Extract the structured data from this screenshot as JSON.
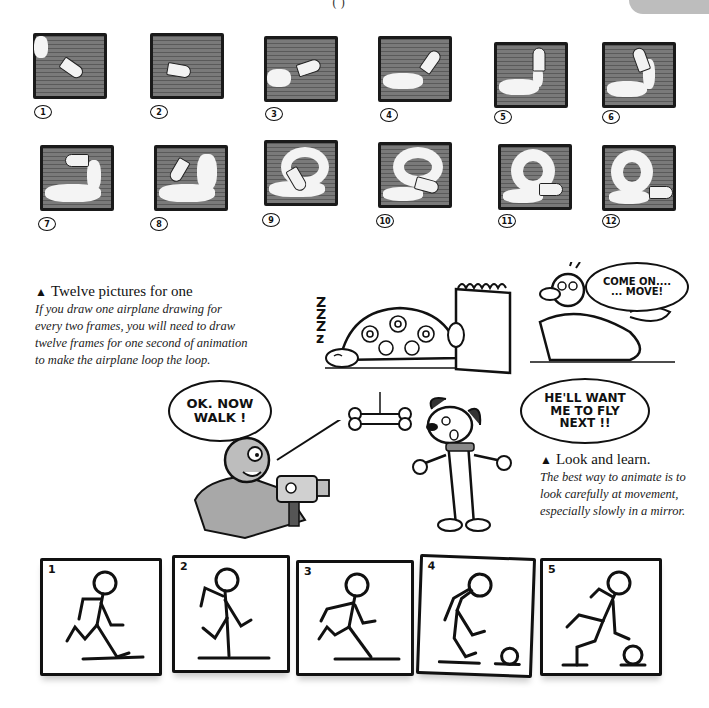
{
  "page": {
    "header_fragment": "( )"
  },
  "airplane_sequence": {
    "frames": [
      {
        "label": "1"
      },
      {
        "label": "2"
      },
      {
        "label": "3"
      },
      {
        "label": "4"
      },
      {
        "label": "5"
      },
      {
        "label": "6"
      },
      {
        "label": "7"
      },
      {
        "label": "8"
      },
      {
        "label": "9"
      },
      {
        "label": "10"
      },
      {
        "label": "11"
      },
      {
        "label": "12"
      }
    ]
  },
  "caption_twelve": {
    "marker": "▲",
    "title": "Twelve pictures for one",
    "body": "If you draw one airplane drawing for every two frames, you will need to draw twelve frames for one second of animation to make the airplane loop the loop.",
    "lines": [
      "If you draw one airplane drawing for",
      "every two frames, you will need to draw",
      "twelve frames for one second of animation",
      "to make the airplane loop the loop."
    ]
  },
  "cartoon_tortoise": {
    "sleep_text": "Z Z Z z",
    "speech": "COME ON.... ...MOVE!",
    "speech_lines": [
      "COME ON....",
      "... MOVE!"
    ]
  },
  "cartoon_dog": {
    "left_speech_lines": [
      "OK. NOW",
      "WALK !"
    ],
    "right_speech_lines": [
      "HE'LL WANT",
      "ME TO FLY",
      "NEXT !!"
    ]
  },
  "caption_look": {
    "marker": "▲",
    "title": "Look and learn.",
    "lines": [
      "The best way to animate is to",
      "look carefully at movement,",
      "especially slowly in a mirror."
    ]
  },
  "walk_sequence": {
    "frames": [
      {
        "label": "1"
      },
      {
        "label": "2"
      },
      {
        "label": "3"
      },
      {
        "label": "4"
      },
      {
        "label": "5"
      }
    ]
  },
  "colors": {
    "frame_fill": "#6e6e6e",
    "ink": "#111111",
    "smoke": "#f4f4f4",
    "shading": "#a8a8a8"
  }
}
